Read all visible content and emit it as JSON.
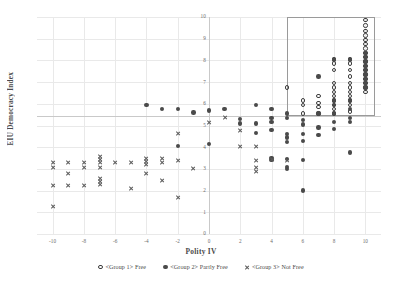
{
  "chart_data": {
    "type": "scatter",
    "title": "",
    "xlabel": "Polity IV",
    "ylabel": "EIU Democracy Index",
    "xlim": [
      -11,
      11
    ],
    "ylim": [
      0,
      10
    ],
    "xticks": [
      -10,
      -8,
      -6,
      -4,
      -2,
      0,
      2,
      4,
      6,
      8,
      10
    ],
    "yticks": [
      0,
      1,
      2,
      3,
      4,
      5,
      6,
      7,
      8,
      9,
      10
    ],
    "grid": true,
    "legend_position": "bottom",
    "annotations": [
      {
        "name": "highlight-rectangle",
        "type": "rect",
        "x0": 5.0,
        "x1": 10.6,
        "y0": 5.45,
        "y1": 10.0
      }
    ],
    "series": [
      {
        "name": "<Group 1> Free",
        "marker": "open-circle",
        "color": "#3d3d3d",
        "points": [
          [
            5,
            6.75
          ],
          [
            6,
            6.15
          ],
          [
            6,
            5.95
          ],
          [
            6,
            5.55
          ],
          [
            7,
            6.35
          ],
          [
            7,
            6.05
          ],
          [
            7,
            5.85
          ],
          [
            7,
            5.55
          ],
          [
            8,
            8.05
          ],
          [
            8,
            7.85
          ],
          [
            8,
            7.55
          ],
          [
            8,
            6.95
          ],
          [
            8,
            6.75
          ],
          [
            8,
            6.55
          ],
          [
            8,
            6.35
          ],
          [
            8,
            6.15
          ],
          [
            8,
            5.95
          ],
          [
            8,
            5.75
          ],
          [
            8,
            5.55
          ],
          [
            9,
            8.05
          ],
          [
            9,
            7.85
          ],
          [
            9,
            7.55
          ],
          [
            9,
            7.25
          ],
          [
            9,
            6.95
          ],
          [
            9,
            6.75
          ],
          [
            9,
            6.55
          ],
          [
            9,
            6.35
          ],
          [
            9,
            6.15
          ],
          [
            9,
            5.95
          ],
          [
            9,
            5.65
          ],
          [
            10,
            9.85
          ],
          [
            10,
            9.6
          ],
          [
            10,
            9.35
          ],
          [
            10,
            9.15
          ],
          [
            10,
            8.95
          ],
          [
            10,
            8.75
          ],
          [
            10,
            8.55
          ],
          [
            10,
            8.35
          ],
          [
            10,
            8.15
          ],
          [
            10,
            7.95
          ],
          [
            10,
            7.75
          ],
          [
            10,
            7.55
          ],
          [
            10,
            7.35
          ],
          [
            10,
            7.15
          ],
          [
            10,
            6.95
          ],
          [
            10,
            6.75
          ],
          [
            10,
            6.55
          ]
        ]
      },
      {
        "name": "<Group 2> Partly Free",
        "marker": "filled-circle",
        "color": "#4a4a4a",
        "points": [
          [
            -4,
            5.95
          ],
          [
            -3,
            5.75
          ],
          [
            -2,
            5.75
          ],
          [
            -2,
            4.05
          ],
          [
            -1,
            5.6
          ],
          [
            0,
            5.7
          ],
          [
            0,
            4.15
          ],
          [
            1,
            5.75
          ],
          [
            2,
            5.3
          ],
          [
            2,
            5.1
          ],
          [
            3,
            5.95
          ],
          [
            3,
            5.1
          ],
          [
            3,
            4.65
          ],
          [
            4,
            5.75
          ],
          [
            4,
            5.35
          ],
          [
            4,
            5.15
          ],
          [
            4,
            4.8
          ],
          [
            4,
            3.5
          ],
          [
            4,
            3.4
          ],
          [
            5,
            5.55
          ],
          [
            5,
            5.35
          ],
          [
            5,
            4.6
          ],
          [
            5,
            4.45
          ],
          [
            5,
            4.25
          ],
          [
            5,
            3.45
          ],
          [
            5,
            3.1
          ],
          [
            5,
            3.0
          ],
          [
            6,
            5.25
          ],
          [
            6,
            5.05
          ],
          [
            6,
            4.6
          ],
          [
            6,
            4.3
          ],
          [
            6,
            3.4
          ],
          [
            6,
            2.0
          ],
          [
            7,
            7.25
          ],
          [
            7,
            5.55
          ],
          [
            7,
            4.9
          ],
          [
            7,
            4.55
          ],
          [
            8,
            8.05
          ],
          [
            8,
            6.15
          ],
          [
            8,
            5.95
          ],
          [
            8,
            5.55
          ],
          [
            8,
            5.15
          ],
          [
            8,
            4.85
          ],
          [
            9,
            8.05
          ],
          [
            9,
            6.15
          ],
          [
            9,
            5.75
          ],
          [
            9,
            5.35
          ],
          [
            9,
            5.15
          ],
          [
            9,
            3.75
          ],
          [
            10,
            8.35
          ],
          [
            10,
            8.15
          ],
          [
            10,
            7.95
          ],
          [
            10,
            7.75
          ],
          [
            10,
            7.55
          ],
          [
            10,
            7.35
          ],
          [
            10,
            7.15
          ],
          [
            10,
            6.95
          ],
          [
            10,
            6.75
          ]
        ]
      },
      {
        "name": "<Group 3> Not Free",
        "marker": "cross",
        "color": "#5a5a5a",
        "points": [
          [
            -10,
            3.3
          ],
          [
            -10,
            3.05
          ],
          [
            -10,
            2.25
          ],
          [
            -10,
            1.25
          ],
          [
            -9,
            3.3
          ],
          [
            -9,
            2.8
          ],
          [
            -9,
            2.25
          ],
          [
            -8,
            3.3
          ],
          [
            -8,
            3.05
          ],
          [
            -8,
            2.25
          ],
          [
            -7,
            3.55
          ],
          [
            -7,
            3.45
          ],
          [
            -7,
            3.3
          ],
          [
            -7,
            3.05
          ],
          [
            -7,
            2.55
          ],
          [
            -7,
            2.4
          ],
          [
            -7,
            2.3
          ],
          [
            -6,
            3.3
          ],
          [
            -5,
            3.3
          ],
          [
            -5,
            2.1
          ],
          [
            -4,
            3.5
          ],
          [
            -4,
            3.35
          ],
          [
            -4,
            3.2
          ],
          [
            -4,
            2.8
          ],
          [
            -3,
            3.5
          ],
          [
            -3,
            3.3
          ],
          [
            -3,
            2.45
          ],
          [
            -2,
            4.65
          ],
          [
            -2,
            3.4
          ],
          [
            -2,
            1.7
          ],
          [
            -1,
            3.0
          ],
          [
            0,
            5.15
          ],
          [
            1,
            5.35
          ],
          [
            2,
            4.75
          ],
          [
            2,
            4.05
          ],
          [
            3,
            4.05
          ],
          [
            3,
            3.4
          ],
          [
            3,
            3.05
          ],
          [
            3,
            2.9
          ],
          [
            4,
            3.45
          ],
          [
            5,
            3.4
          ]
        ]
      }
    ]
  },
  "legend": {
    "items": [
      {
        "label": "<Group 1> Free",
        "marker": "open-circle"
      },
      {
        "label": "<Group 2> Partly Free",
        "marker": "filled-circle"
      },
      {
        "label": "<Group 3> Not Free",
        "marker": "cross"
      }
    ]
  }
}
